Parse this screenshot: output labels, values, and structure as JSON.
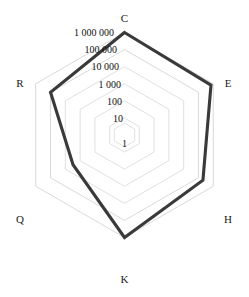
{
  "chart_data": {
    "type": "radar",
    "title": "",
    "subtitle": "",
    "xlabel": "",
    "ylabel": "",
    "scale": "log",
    "grid": true,
    "legend_position": "none",
    "categories": [
      "C",
      "E",
      "H",
      "K",
      "Q",
      "R"
    ],
    "tick_labels": [
      "1",
      "10",
      "100",
      "1 000",
      "10 000",
      "100 000",
      "1 000 000"
    ],
    "tick_values": [
      1,
      10,
      100,
      1000,
      10000,
      100000,
      1000000
    ],
    "rlim": [
      1,
      1000000
    ],
    "series": [
      {
        "name": "series-1",
        "color": "#3a3a3a",
        "values": [
          1000000,
          700000,
          200000,
          1000000,
          3000,
          100000
        ]
      }
    ]
  },
  "axes": {
    "vertices": [
      {
        "key": "C",
        "label": "C"
      },
      {
        "key": "E",
        "label": "E"
      },
      {
        "key": "H",
        "label": "H"
      },
      {
        "key": "K",
        "label": "K"
      },
      {
        "key": "Q",
        "label": "Q"
      },
      {
        "key": "R",
        "label": "R"
      }
    ]
  },
  "ticks": {
    "labels": [
      {
        "text": "1 000 000"
      },
      {
        "text": "100 000"
      },
      {
        "text": "10 000"
      },
      {
        "text": "1 000"
      },
      {
        "text": "100"
      },
      {
        "text": "10"
      },
      {
        "text": "1"
      }
    ]
  },
  "colors": {
    "series": "#3a3a3a",
    "grid": "#c9c9c9",
    "text": "#1a1a1a",
    "background": "#ffffff"
  }
}
